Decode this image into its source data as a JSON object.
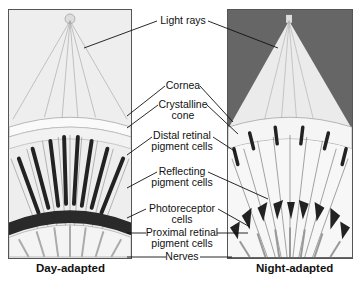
{
  "labels": {
    "light_rays": "Light rays",
    "cornea": "Cornea",
    "crystalline_cone_1": "Crystalline",
    "crystalline_cone_2": "cone",
    "distal_1": "Distal retinal",
    "distal_2": "pigment cells",
    "reflecting_1": "Reflecting",
    "reflecting_2": "pigment cells",
    "photoreceptor_1": "Photoreceptor",
    "photoreceptor_2": "cells",
    "proximal_1": "Proximal retinal",
    "proximal_2": "pigment cells",
    "nerves": "Nerves"
  },
  "captions": {
    "left": "Day-adapted",
    "right": "Night-adapted"
  },
  "colors": {
    "day_bg": "#eeeeee",
    "night_bg": "#666666",
    "pigment": "#222222",
    "cone_light": "#e8e8e8"
  }
}
